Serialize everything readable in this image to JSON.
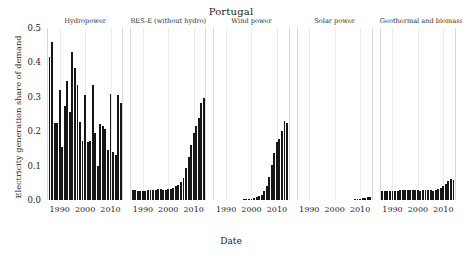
{
  "chart_data": {
    "type": "bar",
    "title": "Portugal",
    "xlabel": "Date",
    "ylabel": "Electricity generation share of demand",
    "ylim": [
      0.0,
      0.5
    ],
    "yticks": [
      "0.0",
      "0.1",
      "0.2",
      "0.3",
      "0.4",
      "0.5"
    ],
    "ytick_values": [
      0.0,
      0.1,
      0.2,
      0.3,
      0.4,
      0.5
    ],
    "xlim": [
      1985,
      2015
    ],
    "xticks": [
      "1990",
      "2000",
      "2010"
    ],
    "xtick_values": [
      1990,
      2000,
      2010
    ],
    "grid": true,
    "legend": "none",
    "facet_layout": "1 row x 5 columns, shared y axis",
    "panels": [
      {
        "name": "Hydropower",
        "x": [
          1986,
          1987,
          1988,
          1989,
          1990,
          1991,
          1992,
          1993,
          1994,
          1995,
          1996,
          1997,
          1998,
          1999,
          2000,
          2001,
          2002,
          2003,
          2004,
          2005,
          2006,
          2007,
          2008,
          2009,
          2010,
          2011,
          2012,
          2013,
          2014
        ],
        "values": [
          0.415,
          0.459,
          0.224,
          0.224,
          0.321,
          0.154,
          0.274,
          0.345,
          0.255,
          0.429,
          0.383,
          0.334,
          0.227,
          0.172,
          0.305,
          0.17,
          0.172,
          0.333,
          0.196,
          0.1,
          0.222,
          0.214,
          0.207,
          0.146,
          0.307,
          0.139,
          0.132,
          0.306,
          0.283
        ]
      },
      {
        "name": "RES-E (without hydro)",
        "x": [
          1986,
          1987,
          1988,
          1989,
          1990,
          1991,
          1992,
          1993,
          1994,
          1995,
          1996,
          1997,
          1998,
          1999,
          2000,
          2001,
          2002,
          2003,
          2004,
          2005,
          2006,
          2007,
          2008,
          2009,
          2010,
          2011,
          2012,
          2013,
          2014
        ],
        "values": [
          0.03,
          0.03,
          0.027,
          0.026,
          0.027,
          0.027,
          0.028,
          0.029,
          0.029,
          0.03,
          0.031,
          0.031,
          0.03,
          0.03,
          0.032,
          0.031,
          0.036,
          0.041,
          0.043,
          0.053,
          0.065,
          0.092,
          0.126,
          0.16,
          0.195,
          0.216,
          0.237,
          0.283,
          0.296
        ]
      },
      {
        "name": "Wind power",
        "x": [
          1986,
          1987,
          1988,
          1989,
          1990,
          1991,
          1992,
          1993,
          1994,
          1995,
          1996,
          1997,
          1998,
          1999,
          2000,
          2001,
          2002,
          2003,
          2004,
          2005,
          2006,
          2007,
          2008,
          2009,
          2010,
          2011,
          2012,
          2013,
          2014
        ],
        "values": [
          0.0,
          0.0,
          0.0,
          0.0,
          0.0,
          0.0,
          0.0,
          0.0,
          0.0,
          0.0,
          0.0,
          0.001,
          0.001,
          0.002,
          0.004,
          0.005,
          0.008,
          0.011,
          0.015,
          0.025,
          0.042,
          0.068,
          0.102,
          0.136,
          0.169,
          0.178,
          0.201,
          0.229,
          0.225
        ]
      },
      {
        "name": "Solar power",
        "x": [
          2008,
          2009,
          2010,
          2011,
          2012,
          2013,
          2014
        ],
        "values": [
          0.0004,
          0.0012,
          0.004,
          0.0052,
          0.0068,
          0.0082,
          0.0088
        ]
      },
      {
        "name": "Geothermal and biomass",
        "x": [
          1986,
          1987,
          1988,
          1989,
          1990,
          1991,
          1992,
          1993,
          1994,
          1995,
          1996,
          1997,
          1998,
          1999,
          2000,
          2001,
          2002,
          2003,
          2004,
          2005,
          2006,
          2007,
          2008,
          2009,
          2010,
          2011,
          2012,
          2013,
          2014
        ],
        "values": [
          0.026,
          0.027,
          0.026,
          0.025,
          0.026,
          0.026,
          0.027,
          0.028,
          0.028,
          0.029,
          0.029,
          0.029,
          0.029,
          0.028,
          0.028,
          0.027,
          0.028,
          0.03,
          0.029,
          0.029,
          0.027,
          0.03,
          0.031,
          0.036,
          0.042,
          0.048,
          0.056,
          0.062,
          0.058
        ]
      }
    ]
  }
}
